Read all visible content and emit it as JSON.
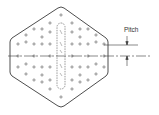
{
  "diagram": {
    "labels": {
      "pitch": "Pitch"
    },
    "colors": {
      "line": "#3a3a3a",
      "background": "#ffffff"
    },
    "elements": [
      "hexagonal-plate",
      "hole-grid",
      "dashed-slot",
      "centerline",
      "pitch-dimension"
    ]
  }
}
